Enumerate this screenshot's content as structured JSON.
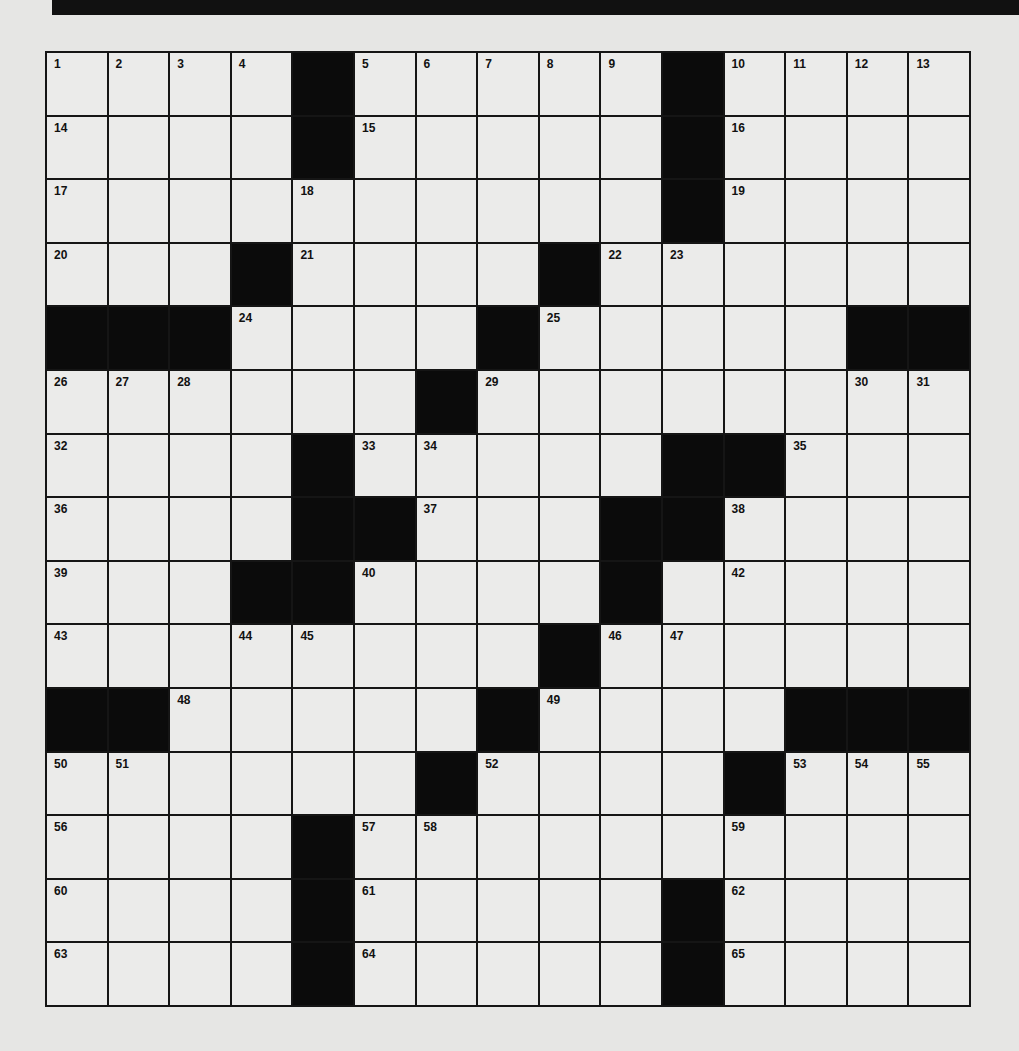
{
  "puzzle": {
    "size": {
      "rows": 15,
      "cols": 15
    },
    "layout": [
      "....#.....#....",
      "....#.....#....",
      "..........#....",
      "...#....#......",
      "###....#.....##",
      "......#........",
      "....#.....##...",
      "....##...##....",
      "...##....#.....",
      "........#......",
      "##.....#....###",
      "......#....#...",
      "....#..........",
      "....#.....#....",
      "....#.....#...."
    ],
    "numbers": [
      {
        "r": 0,
        "c": 0,
        "n": "1"
      },
      {
        "r": 0,
        "c": 1,
        "n": "2"
      },
      {
        "r": 0,
        "c": 2,
        "n": "3"
      },
      {
        "r": 0,
        "c": 3,
        "n": "4"
      },
      {
        "r": 0,
        "c": 5,
        "n": "5"
      },
      {
        "r": 0,
        "c": 6,
        "n": "6"
      },
      {
        "r": 0,
        "c": 7,
        "n": "7"
      },
      {
        "r": 0,
        "c": 8,
        "n": "8"
      },
      {
        "r": 0,
        "c": 9,
        "n": "9"
      },
      {
        "r": 0,
        "c": 11,
        "n": "10"
      },
      {
        "r": 0,
        "c": 12,
        "n": "11"
      },
      {
        "r": 0,
        "c": 13,
        "n": "12"
      },
      {
        "r": 0,
        "c": 14,
        "n": "13"
      },
      {
        "r": 1,
        "c": 0,
        "n": "14"
      },
      {
        "r": 1,
        "c": 5,
        "n": "15"
      },
      {
        "r": 1,
        "c": 11,
        "n": "16"
      },
      {
        "r": 2,
        "c": 0,
        "n": "17"
      },
      {
        "r": 2,
        "c": 4,
        "n": "18"
      },
      {
        "r": 2,
        "c": 11,
        "n": "19"
      },
      {
        "r": 3,
        "c": 0,
        "n": "20"
      },
      {
        "r": 3,
        "c": 4,
        "n": "21"
      },
      {
        "r": 3,
        "c": 9,
        "n": "22"
      },
      {
        "r": 3,
        "c": 10,
        "n": "23"
      },
      {
        "r": 4,
        "c": 3,
        "n": "24"
      },
      {
        "r": 4,
        "c": 8,
        "n": "25"
      },
      {
        "r": 5,
        "c": 0,
        "n": "26"
      },
      {
        "r": 5,
        "c": 1,
        "n": "27"
      },
      {
        "r": 5,
        "c": 2,
        "n": "28"
      },
      {
        "r": 5,
        "c": 7,
        "n": "29"
      },
      {
        "r": 5,
        "c": 13,
        "n": "30"
      },
      {
        "r": 5,
        "c": 14,
        "n": "31"
      },
      {
        "r": 6,
        "c": 0,
        "n": "32"
      },
      {
        "r": 6,
        "c": 5,
        "n": "33"
      },
      {
        "r": 6,
        "c": 6,
        "n": "34"
      },
      {
        "r": 6,
        "c": 12,
        "n": "35"
      },
      {
        "r": 7,
        "c": 0,
        "n": "36"
      },
      {
        "r": 7,
        "c": 6,
        "n": "37"
      },
      {
        "r": 7,
        "c": 11,
        "n": "38"
      },
      {
        "r": 8,
        "c": 0,
        "n": "39"
      },
      {
        "r": 8,
        "c": 5,
        "n": "40"
      },
      {
        "r": 8,
        "c": 9,
        "n": "41"
      },
      {
        "r": 8,
        "c": 11,
        "n": "42"
      },
      {
        "r": 9,
        "c": 0,
        "n": "43"
      },
      {
        "r": 9,
        "c": 3,
        "n": "44"
      },
      {
        "r": 9,
        "c": 4,
        "n": "45"
      },
      {
        "r": 9,
        "c": 9,
        "n": "46"
      },
      {
        "r": 9,
        "c": 10,
        "n": "47"
      },
      {
        "r": 10,
        "c": 2,
        "n": "48"
      },
      {
        "r": 10,
        "c": 8,
        "n": "49"
      },
      {
        "r": 11,
        "c": 0,
        "n": "50"
      },
      {
        "r": 11,
        "c": 1,
        "n": "51"
      },
      {
        "r": 11,
        "c": 7,
        "n": "52"
      },
      {
        "r": 11,
        "c": 12,
        "n": "53"
      },
      {
        "r": 11,
        "c": 13,
        "n": "54"
      },
      {
        "r": 11,
        "c": 14,
        "n": "55"
      },
      {
        "r": 12,
        "c": 0,
        "n": "56"
      },
      {
        "r": 12,
        "c": 5,
        "n": "57"
      },
      {
        "r": 12,
        "c": 6,
        "n": "58"
      },
      {
        "r": 12,
        "c": 11,
        "n": "59"
      },
      {
        "r": 13,
        "c": 0,
        "n": "60"
      },
      {
        "r": 13,
        "c": 5,
        "n": "61"
      },
      {
        "r": 13,
        "c": 11,
        "n": "62"
      },
      {
        "r": 14,
        "c": 0,
        "n": "63"
      },
      {
        "r": 14,
        "c": 5,
        "n": "64"
      },
      {
        "r": 14,
        "c": 11,
        "n": "65"
      }
    ],
    "entries": {}
  },
  "colors": {
    "paper": "#e6e6e4",
    "cell": "#ebebea",
    "block": "#0b0b0b",
    "rule": "#151515"
  }
}
